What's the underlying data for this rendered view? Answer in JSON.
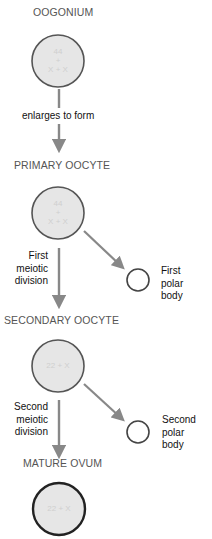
{
  "diagram": {
    "colors": {
      "cell_fill": "#e6e6e6",
      "cell_stroke": "#555555",
      "ovum_stroke": "#222222",
      "arrow": "#888888",
      "stage_title": "#555555",
      "label": "#111111"
    },
    "stages": [
      {
        "id": "oogonium",
        "title": "OOGONIUM",
        "chromosomes": [
          "44",
          "+",
          "X + X"
        ]
      },
      {
        "id": "primary-oocyte",
        "title": "PRIMARY OOCYTE",
        "chromosomes": [
          "44",
          "+",
          "X + X"
        ]
      },
      {
        "id": "secondary-oocyte",
        "title": "SECONDARY OOCYTE",
        "chromosomes": [
          "22 + X"
        ]
      },
      {
        "id": "mature-ovum",
        "title": "MATURE OVUM",
        "chromosomes": [
          "22 + X"
        ]
      }
    ],
    "transitions": [
      {
        "from": "oogonium",
        "to": "primary-oocyte",
        "label": "enlarges to form"
      },
      {
        "from": "primary-oocyte",
        "to": "secondary-oocyte",
        "label_lines": [
          "First",
          "meiotic",
          "division"
        ]
      },
      {
        "from": "secondary-oocyte",
        "to": "mature-ovum",
        "label_lines": [
          "Second",
          "meiotic",
          "division"
        ]
      }
    ],
    "polar_bodies": [
      {
        "from": "primary-oocyte",
        "label_lines": [
          "First",
          "polar",
          "body"
        ]
      },
      {
        "from": "secondary-oocyte",
        "label_lines": [
          "Second",
          "polar",
          "body"
        ]
      }
    ]
  }
}
